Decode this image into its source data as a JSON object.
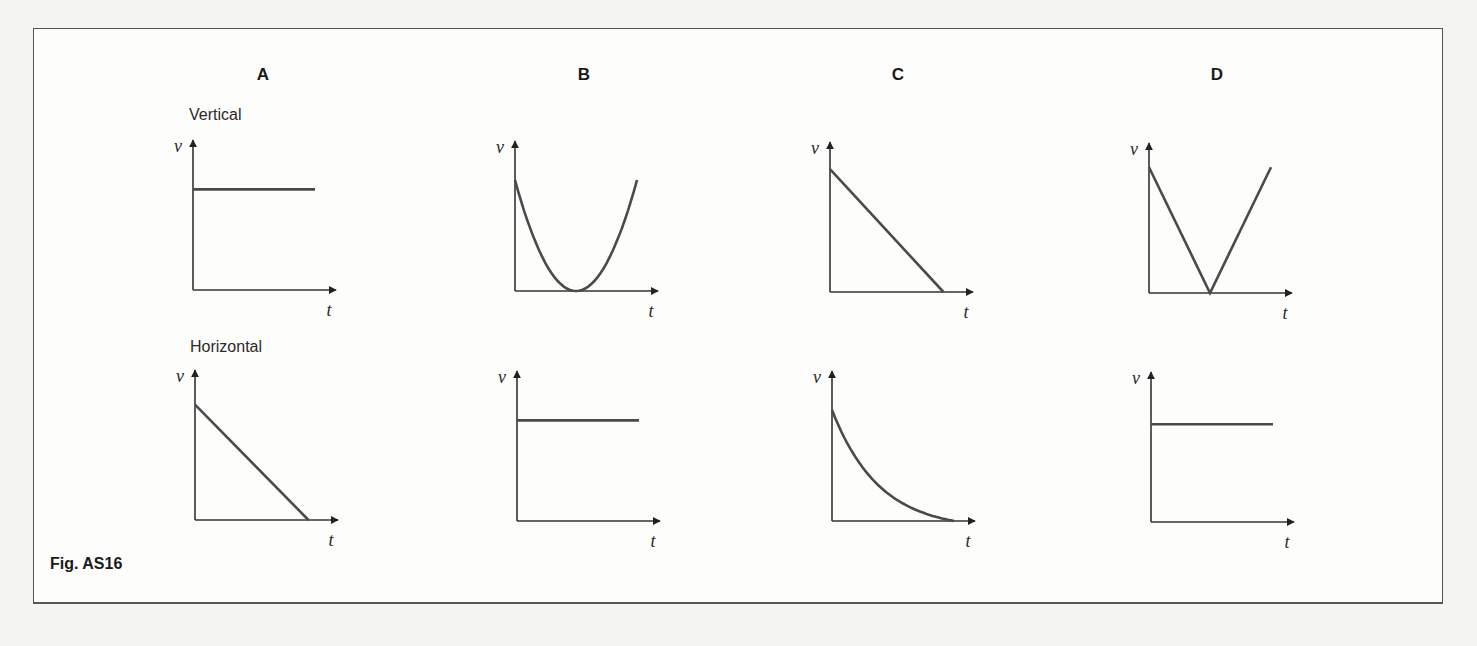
{
  "figure": {
    "caption": "Fig. AS16",
    "columns": [
      "A",
      "B",
      "C",
      "D"
    ],
    "rows": [
      "Vertical",
      "Horizontal"
    ],
    "y_axis_label": "v",
    "x_axis_label": "t"
  },
  "chart_data": [
    {
      "type": "line",
      "option": "A",
      "component": "Vertical",
      "xlabel": "t",
      "ylabel": "v",
      "shape": "constant",
      "x": [
        0,
        1
      ],
      "y": [
        0.68,
        0.68
      ]
    },
    {
      "type": "line",
      "option": "B",
      "component": "Vertical",
      "xlabel": "t",
      "ylabel": "v",
      "shape": "parabola (decreases to zero then increases)",
      "x": [
        0,
        0.5,
        1
      ],
      "y": [
        0.75,
        0,
        0.75
      ]
    },
    {
      "type": "line",
      "option": "C",
      "component": "Vertical",
      "xlabel": "t",
      "ylabel": "v",
      "shape": "linear decrease to zero",
      "x": [
        0,
        1
      ],
      "y": [
        0.83,
        0
      ]
    },
    {
      "type": "line",
      "option": "D",
      "component": "Vertical",
      "xlabel": "t",
      "ylabel": "v",
      "shape": "linear decrease to zero then linear increase",
      "x": [
        0,
        0.5,
        1
      ],
      "y": [
        0.85,
        0,
        0.85
      ]
    },
    {
      "type": "line",
      "option": "A",
      "component": "Horizontal",
      "xlabel": "t",
      "ylabel": "v",
      "shape": "linear decrease to zero",
      "x": [
        0,
        1
      ],
      "y": [
        0.78,
        0
      ]
    },
    {
      "type": "line",
      "option": "B",
      "component": "Horizontal",
      "xlabel": "t",
      "ylabel": "v",
      "shape": "constant",
      "x": [
        0,
        1
      ],
      "y": [
        0.68,
        0.68
      ]
    },
    {
      "type": "line",
      "option": "C",
      "component": "Horizontal",
      "xlabel": "t",
      "ylabel": "v",
      "shape": "exponential-like decay to zero",
      "x": [
        0,
        0.25,
        0.5,
        0.75,
        1
      ],
      "y": [
        0.75,
        0.4,
        0.2,
        0.08,
        0
      ]
    },
    {
      "type": "line",
      "option": "D",
      "component": "Horizontal",
      "xlabel": "t",
      "ylabel": "v",
      "shape": "constant",
      "x": [
        0,
        1
      ],
      "y": [
        0.66,
        0.66
      ]
    }
  ]
}
